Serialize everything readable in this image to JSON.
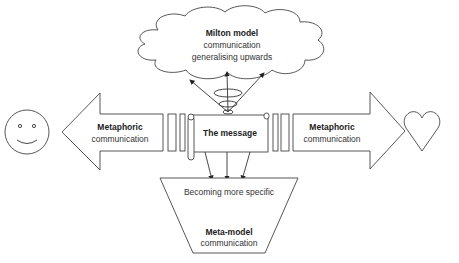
{
  "diagram": {
    "cloud": {
      "title": "Milton model",
      "line2": "communication",
      "line3": "generalising upwards"
    },
    "message": {
      "label": "The message"
    },
    "left_arrow": {
      "line1": "Metaphoric",
      "line2": "communication",
      "target_icon": "smiley-face-icon"
    },
    "right_arrow": {
      "line1": "Metaphoric",
      "line2": "communication",
      "target_icon": "heart-icon"
    },
    "funnel": {
      "top_label": "Becoming more specific",
      "title": "Meta-model",
      "line2": "communication"
    },
    "colors": {
      "stroke": "#444444",
      "text": "#333333",
      "background": "#ffffff"
    }
  }
}
